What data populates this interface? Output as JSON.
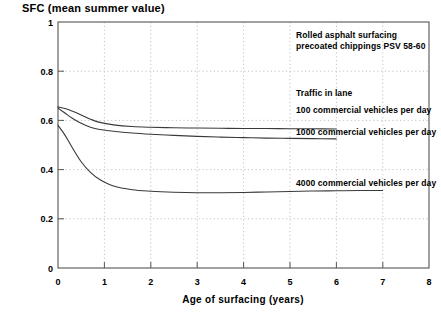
{
  "chart_data": {
    "type": "line",
    "title": "SFC (mean summer value)",
    "xlabel": "Age of surfacing (years)",
    "ylabel": "SFC (mean summer value)",
    "xlim": [
      0,
      8
    ],
    "ylim": [
      0,
      1
    ],
    "grid": true,
    "legend_position": "inline-annotations",
    "x_ticks": [
      "0",
      "1",
      "2",
      "3",
      "4",
      "5",
      "6",
      "7",
      "8"
    ],
    "y_ticks": [
      "0",
      "0.2",
      "0.4",
      "0.6",
      "0.8",
      "1"
    ],
    "annotations": [
      "Rolled asphalt surfacing",
      "precoated chippings PSV 58-60",
      "Traffic in lane"
    ],
    "series": [
      {
        "name": "100 commercial vehicles per day",
        "x": [
          0,
          0.15,
          0.3,
          0.5,
          0.7,
          0.9,
          1.2,
          1.6,
          2.0,
          2.5,
          3.0,
          3.5,
          4.0,
          4.5,
          5.0,
          5.5,
          6.0
        ],
        "values": [
          0.655,
          0.648,
          0.638,
          0.622,
          0.605,
          0.592,
          0.582,
          0.575,
          0.572,
          0.57,
          0.569,
          0.568,
          0.567,
          0.567,
          0.566,
          0.566,
          0.565
        ]
      },
      {
        "name": "1000 commercial vehicles per day",
        "x": [
          0,
          0.15,
          0.3,
          0.5,
          0.7,
          0.9,
          1.2,
          1.6,
          2.0,
          2.5,
          3.0,
          3.5,
          4.0,
          4.5,
          5.0,
          5.5,
          6.0
        ],
        "values": [
          0.65,
          0.63,
          0.61,
          0.588,
          0.572,
          0.563,
          0.556,
          0.549,
          0.544,
          0.539,
          0.535,
          0.532,
          0.53,
          0.528,
          0.527,
          0.526,
          0.525
        ]
      },
      {
        "name": "4000 commercial vehicles per day",
        "x": [
          0,
          0.15,
          0.3,
          0.5,
          0.7,
          0.9,
          1.2,
          1.6,
          2.0,
          2.5,
          3.0,
          3.5,
          4.0,
          4.5,
          5.0,
          5.5,
          6.0,
          6.5,
          7.0
        ],
        "values": [
          0.58,
          0.54,
          0.492,
          0.432,
          0.389,
          0.36,
          0.333,
          0.318,
          0.312,
          0.308,
          0.306,
          0.306,
          0.307,
          0.309,
          0.311,
          0.313,
          0.314,
          0.315,
          0.315
        ]
      }
    ]
  },
  "labels": {
    "title": "SFC (mean summer value)",
    "xaxis_title": "Age of surfacing (years)",
    "annotation_surfacing_line1": "Rolled asphalt surfacing",
    "annotation_surfacing_line2": "precoated chippings PSV 58-60",
    "annotation_traffic_header": "Traffic in lane",
    "annotation_series_100": "100 commercial vehicles per day",
    "annotation_series_1000": "1000 commercial vehicles per day",
    "annotation_series_4000": "4000 commercial vehicles per day"
  },
  "colors": {
    "axis": "#000000",
    "grid": "#b4b4b4",
    "curve": "#333333",
    "background": "#ffffff"
  }
}
